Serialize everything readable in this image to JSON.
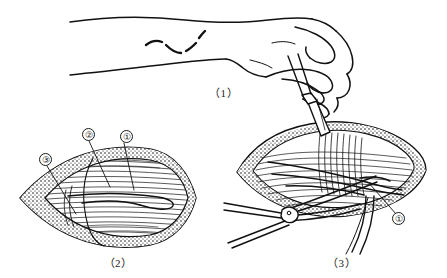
{
  "figure": {
    "background_color": "#ffffff",
    "ink_color": "#111111",
    "panels": [
      {
        "id": "panel-1",
        "caption": "（1）",
        "subject": "forearm-with-hand",
        "description": "Right forearm seen from the radial side with relaxed hand; dashed wavy line marks the planned skin incision over the mid forearm.",
        "markings": [
          "dashed-incision-line"
        ]
      },
      {
        "id": "panel-2",
        "caption": "（2）",
        "subject": "open-wound-lens-shaped",
        "description": "Skin incision opened into a lens/almond shaped wound; stippled cut skin edge surrounds densely hatched muscle belly with a split running through its centre.",
        "labels": [
          {
            "key": "1",
            "glyph": "①",
            "target": "muscle-fibre-split"
          },
          {
            "key": "2",
            "glyph": "②",
            "target": "muscle-belly-surface"
          },
          {
            "key": "3",
            "glyph": "③",
            "target": "cut-skin-subcutaneous-edge"
          }
        ]
      },
      {
        "id": "panel-3",
        "caption": "（3）",
        "subject": "wound-with-instruments",
        "description": "Wound held open with a retractor from above while curved dissecting scissors enter from the lower left; a tape/drain loop passes beneath the exposed structure.",
        "labels": [
          {
            "key": "1",
            "glyph": "①",
            "target": "isolated-structure"
          }
        ],
        "instruments": [
          "retractor-hook",
          "dissecting-scissors",
          "tape-loop"
        ]
      }
    ]
  },
  "labels": {
    "p2_1": "①",
    "p2_2": "②",
    "p2_3": "③",
    "p3_1": "①"
  },
  "captions": {
    "one": "（1）",
    "two": "（2）",
    "three": "（3）"
  }
}
